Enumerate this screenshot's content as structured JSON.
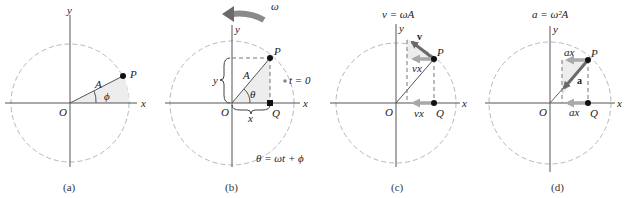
{
  "figure": {
    "panels": [
      {
        "id": "a",
        "caption": "(a)",
        "axis_x": "x",
        "axis_y": "y",
        "origin": "O",
        "point": "P",
        "radius": "A",
        "angle": "ϕ"
      },
      {
        "id": "b",
        "caption": "(b)",
        "axis_x": "x",
        "axis_y": "y",
        "origin": "O",
        "point": "P",
        "projection": "Q",
        "radius": "A",
        "angle": "θ",
        "x_component": "x",
        "y_component": "y",
        "rotation": "ω",
        "t0_marker": "t = 0",
        "equation": "θ = ωt + ϕ"
      },
      {
        "id": "c",
        "caption": "(c)",
        "axis_x": "x",
        "axis_y": "y",
        "origin": "O",
        "point": "P",
        "projection": "Q",
        "title": "v = ωA",
        "vector": "v",
        "component_top": "vx",
        "component_bottom": "vx"
      },
      {
        "id": "d",
        "caption": "(d)",
        "axis_x": "x",
        "axis_y": "y",
        "origin": "O",
        "point": "P",
        "projection": "Q",
        "title": "a = ω²A",
        "vector": "a",
        "component_top": "ax",
        "component_bottom": "ax"
      }
    ],
    "colors": {
      "axis": "#555555",
      "circle": "#b8b8b8",
      "vector": "#6a6a6a",
      "component_arrow": "#a9a9a9",
      "shade": "#ededed",
      "point": "#111111"
    }
  }
}
